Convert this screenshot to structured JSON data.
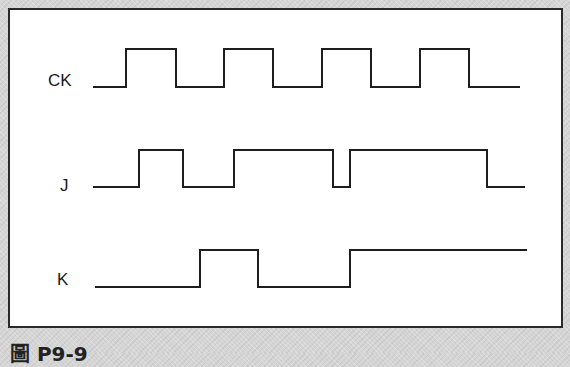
{
  "diagram": {
    "type": "timing-diagram",
    "signals": [
      {
        "name": "CK",
        "label_pos": [
          48,
          71
        ],
        "low_y": 87,
        "high_y": 49,
        "start_x": 93,
        "end_x": 520,
        "initial": 0,
        "edges": [
          126,
          176,
          224,
          273,
          322,
          371,
          420,
          469
        ]
      },
      {
        "name": "J",
        "label_pos": [
          60,
          176
        ],
        "low_y": 187,
        "high_y": 150,
        "start_x": 93,
        "end_x": 525,
        "initial": 0,
        "edges": [
          139,
          183,
          234,
          333,
          350,
          487
        ]
      },
      {
        "name": "K",
        "label_pos": [
          57,
          270
        ],
        "low_y": 287,
        "high_y": 250,
        "start_x": 95,
        "end_x": 527,
        "initial": 0,
        "edges": [
          200,
          258,
          350
        ]
      }
    ],
    "caption": "圖 P9-9"
  }
}
